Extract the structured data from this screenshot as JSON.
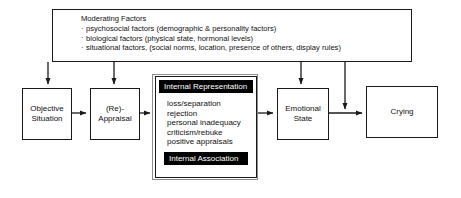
{
  "diagram": {
    "moderating": {
      "title": "Moderating Factors",
      "items": [
        "psychosocial factors (demographic & personality factors)",
        "biological factors (physical state, hormonal levels)",
        "situational factors, (social norms, location, presence of others, display rules)"
      ]
    },
    "nodes": {
      "objective_situation": "Objective\nSituation",
      "objective_situation_line1": "Objective",
      "objective_situation_line2": "Situation",
      "reappraisal_line1": "(Re)-",
      "reappraisal_line2": "Appraisal",
      "emotional_state_line1": "Emotional",
      "emotional_state_line2": "State",
      "crying": "Crying"
    },
    "internal_representation": {
      "header": "Internal Representation",
      "items": [
        "loss/separation",
        "rejection",
        "personal inadequacy",
        "criticism/rebuke",
        "positive appraisals"
      ],
      "footer": "Internal Association"
    },
    "colors": {
      "stroke": "#1a1a1a",
      "fill": "#ffffff",
      "bar_fill": "#000000",
      "bar_text": "#ffffff",
      "outer_frame": "#8c8c8c"
    }
  }
}
